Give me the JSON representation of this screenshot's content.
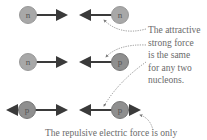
{
  "diagram": {
    "rows": [
      {
        "left": "n",
        "right": "n"
      },
      {
        "left": "n",
        "right": "p"
      },
      {
        "left": "p",
        "right": "p"
      }
    ],
    "caption_lines": [
      "The attractive",
      "strong force",
      "is the same",
      "for any two",
      "nucleons."
    ],
    "bottom_caption": "The repulsive electric force is only"
  },
  "colors": {
    "neutron": "#a8a8a8",
    "proton": "#8f8f8f",
    "arrow": "#3a3a3a",
    "text": "#6a6a6a",
    "dotted": "#7a7a7a"
  }
}
